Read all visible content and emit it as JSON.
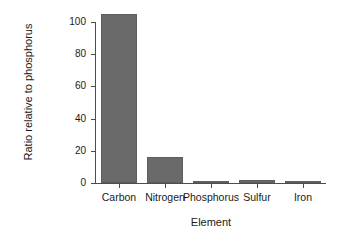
{
  "chart_data": {
    "type": "bar",
    "title": "",
    "xlabel": "Element",
    "ylabel": "Ratio relative to phosphorus",
    "categories": [
      "Carbon",
      "Nitrogen",
      "Phosphorus",
      "Sulfur",
      "Iron"
    ],
    "values": [
      105,
      16,
      1,
      2,
      0.25
    ],
    "ylim": [
      0,
      108
    ],
    "yticks": [
      0,
      20,
      40,
      60,
      80,
      100
    ],
    "ytick_labels": [
      "0",
      "20",
      "40",
      "60",
      "80",
      "100"
    ],
    "grid": false,
    "legend": false,
    "legend_position": "none",
    "bar_color": "#6a6a6a",
    "bar_edge_color": "#5e5e5e",
    "axis_color": "#4d4d4d",
    "background_color": "#ffffff",
    "series": [
      {
        "name": "Ratio relative to phosphorus",
        "values": [
          105,
          16,
          1,
          2,
          0.25
        ]
      }
    ]
  }
}
